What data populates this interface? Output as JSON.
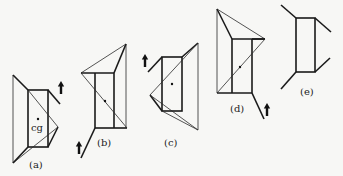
{
  "diagram": {
    "panels": [
      {
        "id": "a",
        "label": "(a)",
        "cg_label": "cg",
        "arrow": "force-up-right"
      },
      {
        "id": "b",
        "label": "(b)",
        "arrow": "force-up-bottom-left"
      },
      {
        "id": "c",
        "label": "(c)",
        "arrow": "force-up-top-left"
      },
      {
        "id": "d",
        "label": "(d)",
        "arrow": "force-up-bottom-right"
      },
      {
        "id": "e",
        "label": "(e)",
        "arrow": null
      }
    ],
    "icons": {
      "arrow": "up-arrow-icon",
      "cg_marker": "dot"
    },
    "colors": {
      "line": "#1a1a1a",
      "background": "#f7f7f5"
    }
  }
}
